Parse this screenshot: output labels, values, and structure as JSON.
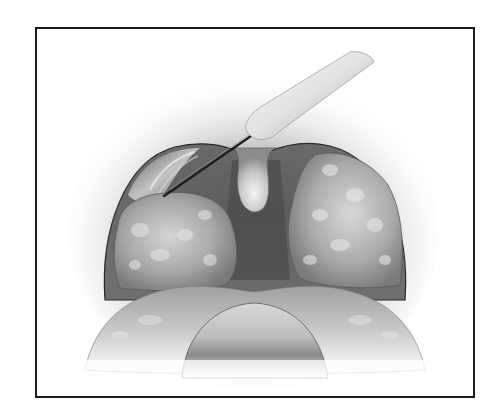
{
  "figure": {
    "description": "Grayscale medical illustration of a tonsillectomy: open mouth view showing enlarged tonsils, uvula, tongue, and a surgical instrument (electrocautery needle) dissecting the left tonsil",
    "elements": [
      "frame-border",
      "mouth-opening",
      "left-tonsil",
      "right-tonsil",
      "uvula",
      "tongue",
      "surgical-instrument"
    ],
    "colors": {
      "frame": "#1a1a1a",
      "background": "#ffffff",
      "cavity_dark": "#4a4a4a",
      "tissue_mid": "#9a9a9a",
      "tissue_light": "#d8d8d8",
      "instrument": "#e8e8e8",
      "needle": "#222222"
    }
  }
}
